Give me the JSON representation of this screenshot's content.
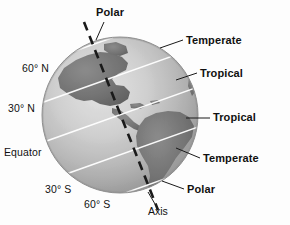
{
  "figure": {
    "globe": {
      "center_x": 120,
      "center_y": 115,
      "radius": 78,
      "tilt_degrees": 20,
      "ocean_color": "#b9b9b9",
      "land_color": "#6f6f6f",
      "graticule_color": "#ffffff",
      "axis_color": "#161616"
    }
  },
  "latitude_labels": [
    {
      "id": "lat-60n",
      "text": "60° N"
    },
    {
      "id": "lat-30n",
      "text": "30° N"
    },
    {
      "id": "lat-equator",
      "text": "Equator"
    },
    {
      "id": "lat-30s",
      "text": "30° S"
    },
    {
      "id": "lat-60s",
      "text": "60° S"
    }
  ],
  "zone_labels": [
    {
      "id": "polar-north",
      "text": "Polar"
    },
    {
      "id": "temperate-north",
      "text": "Temperate"
    },
    {
      "id": "tropical-north",
      "text": "Tropical"
    },
    {
      "id": "tropical-south",
      "text": "Tropical"
    },
    {
      "id": "temperate-south",
      "text": "Temperate"
    },
    {
      "id": "polar-south",
      "text": "Polar"
    }
  ],
  "axis_label": {
    "id": "axis",
    "text": "Axis"
  }
}
